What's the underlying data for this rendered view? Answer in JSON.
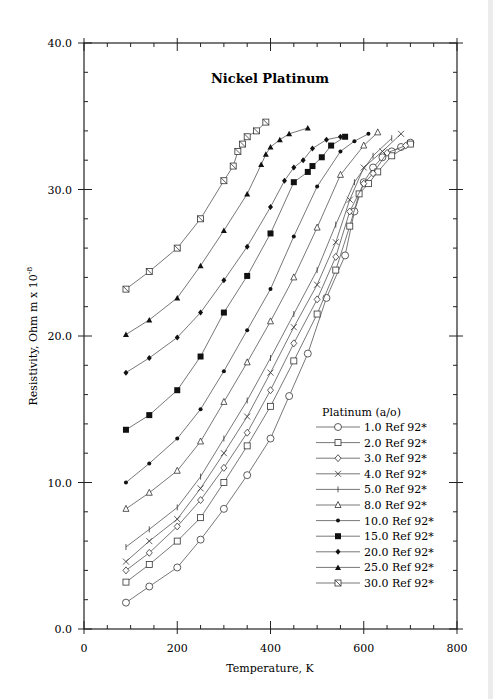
{
  "chart_data": {
    "type": "line",
    "title": "Nickel Platinum",
    "xlabel": "Temperature,  K",
    "ylabel": "Resistivity, Ohm m x 10^-8",
    "xlim": [
      0,
      800
    ],
    "ylim": [
      0,
      40
    ],
    "xticks": [
      0,
      200,
      400,
      600,
      800
    ],
    "yticks": [
      "0.0",
      "10.0",
      "20.0",
      "30.0",
      "40.0"
    ],
    "grid": false,
    "legend_title": "Platinum (a/o)",
    "legend_position": "lower right",
    "series": [
      {
        "name": "1.0 Ref 92*",
        "marker": "circle",
        "x": [
          90,
          140,
          200,
          250,
          300,
          350,
          400,
          440,
          480,
          520,
          560,
          580,
          600,
          620,
          640,
          660,
          680,
          700
        ],
        "y": [
          1.8,
          2.9,
          4.2,
          6.1,
          8.2,
          10.5,
          13,
          15.9,
          18.8,
          22.6,
          25.5,
          28.5,
          30.5,
          31.5,
          32.2,
          32.6,
          32.9,
          33.2
        ]
      },
      {
        "name": "2.0 Ref 92*",
        "marker": "square-open",
        "x": [
          90,
          140,
          200,
          250,
          300,
          350,
          400,
          450,
          500,
          540,
          570,
          590,
          610,
          630,
          660,
          700
        ],
        "y": [
          3.2,
          4.4,
          6,
          7.6,
          10,
          12.5,
          15.2,
          18.3,
          21.5,
          24.5,
          27.5,
          29.7,
          30.4,
          31.2,
          32.3,
          33.1
        ]
      },
      {
        "name": "3.0 Ref 92*",
        "marker": "diamond-open",
        "x": [
          90,
          140,
          200,
          250,
          300,
          350,
          400,
          450,
          500,
          540,
          570,
          600,
          620,
          650,
          690
        ],
        "y": [
          4.0,
          5.2,
          7.0,
          8.8,
          11,
          13.4,
          16.3,
          19.5,
          22.5,
          25.4,
          28.5,
          30.4,
          31.1,
          32.5,
          33.0
        ]
      },
      {
        "name": "4.0 Ref 92*",
        "marker": "x",
        "x": [
          90,
          140,
          200,
          250,
          300,
          350,
          400,
          450,
          500,
          540,
          570,
          600,
          640,
          680
        ],
        "y": [
          4.6,
          6.0,
          7.5,
          9.6,
          12,
          14.5,
          17.5,
          20.6,
          23.5,
          26.4,
          29.3,
          31.5,
          32.6,
          33.8
        ]
      },
      {
        "name": "5.0 Ref 92*",
        "marker": "plus",
        "x": [
          90,
          140,
          200,
          250,
          300,
          350,
          400,
          450,
          500,
          540,
          580,
          620,
          660
        ],
        "y": [
          5.6,
          6.8,
          8.3,
          10.4,
          13,
          15.6,
          18.5,
          21.5,
          24.5,
          27.6,
          30.5,
          32.3,
          33.5
        ]
      },
      {
        "name": "8.0 Ref 92*",
        "marker": "triangle-open",
        "x": [
          90,
          140,
          200,
          250,
          300,
          350,
          400,
          450,
          500,
          550,
          600,
          630
        ],
        "y": [
          8.2,
          9.3,
          10.8,
          12.8,
          15.5,
          18.2,
          21,
          24,
          27.4,
          31.0,
          33.0,
          33.9
        ]
      },
      {
        "name": "10.0 Ref 92*",
        "marker": "circle-filled",
        "x": [
          90,
          140,
          200,
          250,
          300,
          350,
          400,
          450,
          500,
          550,
          580,
          610
        ],
        "y": [
          10.0,
          11.3,
          13,
          15,
          17.6,
          20.4,
          23.2,
          26.8,
          30.2,
          32.6,
          33.3,
          33.8
        ]
      },
      {
        "name": "15.0 Ref 92*",
        "marker": "square-filled",
        "x": [
          90,
          140,
          200,
          250,
          300,
          350,
          400,
          450,
          480,
          490,
          510,
          530,
          560
        ],
        "y": [
          13.6,
          14.6,
          16.3,
          18.6,
          21.6,
          24.1,
          27.0,
          30.5,
          31.2,
          31.6,
          32.2,
          33.0,
          33.6
        ]
      },
      {
        "name": "20.0 Ref 92*",
        "marker": "diamond-filled",
        "x": [
          90,
          140,
          200,
          250,
          300,
          350,
          400,
          430,
          450,
          470,
          490,
          520,
          550
        ],
        "y": [
          17.5,
          18.5,
          19.9,
          21.6,
          23.8,
          26.1,
          28.8,
          30.6,
          31.5,
          32.0,
          32.8,
          33.4,
          33.6
        ]
      },
      {
        "name": "25.0 Ref 92*",
        "marker": "triangle-filled",
        "x": [
          90,
          140,
          200,
          250,
          300,
          350,
          380,
          390,
          400,
          420,
          440,
          480
        ],
        "y": [
          20.1,
          21.1,
          22.6,
          24.8,
          27.2,
          29.7,
          31.7,
          32.4,
          32.9,
          33.4,
          33.8,
          34.2
        ]
      },
      {
        "name": "30.0 Ref 92*",
        "marker": "hourglass",
        "x": [
          90,
          140,
          200,
          250,
          300,
          320,
          330,
          340,
          350,
          370,
          390
        ],
        "y": [
          23.2,
          24.4,
          26.0,
          28.0,
          30.6,
          31.6,
          32.6,
          33.1,
          33.6,
          34.0,
          34.6
        ]
      }
    ]
  }
}
